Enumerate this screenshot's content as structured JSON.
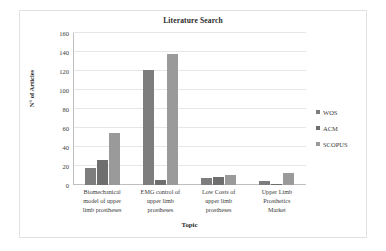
{
  "chart_data": {
    "type": "bar",
    "title": "Literature Search",
    "xlabel": "Topic",
    "ylabel": "N° of Articles",
    "ylim": [
      0,
      160
    ],
    "yticks": [
      0,
      20,
      40,
      60,
      80,
      100,
      120,
      140,
      160
    ],
    "grid": true,
    "legend_position": "right",
    "categories": [
      "Biomechanical model of upper limb prostheses",
      "EMG control of upper limb prostheses",
      "Low Costs of upper limb prostheses",
      "Upper Limb Prosthetics Market"
    ],
    "category_lines": [
      [
        "Biomechanical",
        "model of upper",
        "limb prostheses"
      ],
      [
        "EMG control of",
        "upper limb",
        "prostheses"
      ],
      [
        "Low Costs of",
        "upper limb",
        "prostheses"
      ],
      [
        "Upper Limb",
        "Prosthetics",
        "Market"
      ]
    ],
    "series": [
      {
        "name": "WOS",
        "color": "#7d7d7d",
        "values": [
          18,
          121,
          7,
          4
        ]
      },
      {
        "name": "ACM",
        "color": "#6e6e6e",
        "values": [
          26,
          5,
          8,
          1
        ]
      },
      {
        "name": "SCOPUS",
        "color": "#9a9a9a",
        "values": [
          55,
          138,
          11,
          13
        ]
      }
    ]
  }
}
